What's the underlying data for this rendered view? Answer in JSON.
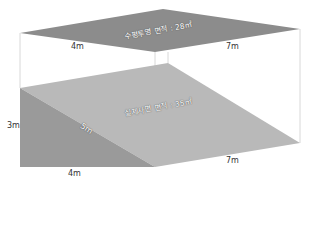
{
  "diagram": {
    "top_plane": {
      "label": "수평투영 면적 : 28㎡",
      "edge_left": "4m",
      "edge_right": "7m"
    },
    "slope_plane": {
      "label": "실제사면 면적 : 35㎡",
      "height": "3m",
      "hypotenuse": "5m",
      "bottom_left": "4m",
      "bottom_right": "7m"
    },
    "colors": {
      "top_plane": "#8c8c8c",
      "slope_face": "#b9b9b9",
      "side_face": "#9a9a9a",
      "guide_line": "#d8d8d8"
    }
  }
}
